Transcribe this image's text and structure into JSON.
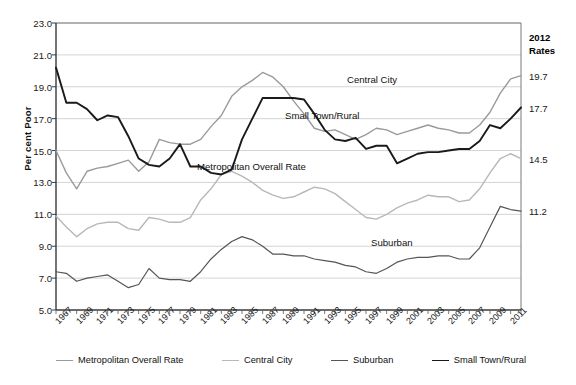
{
  "chart_data": {
    "type": "line",
    "title": "",
    "xlabel": "",
    "ylabel": "Per cent Poor",
    "ylim": [
      5.0,
      23.0
    ],
    "ytick_labels": [
      "23.0",
      "21.0",
      "19.0",
      "17.0",
      "15.0",
      "13.0",
      "11.0",
      "9.0",
      "7.0",
      "5.0"
    ],
    "ytick_values": [
      23.0,
      21.0,
      19.0,
      17.0,
      15.0,
      13.0,
      11.0,
      9.0,
      7.0,
      5.0
    ],
    "grid": true,
    "grid_axis": "y",
    "legend_position": "bottom",
    "x": [
      1967,
      1968,
      1969,
      1970,
      1971,
      1972,
      1973,
      1974,
      1975,
      1976,
      1977,
      1978,
      1979,
      1980,
      1981,
      1982,
      1983,
      1984,
      1985,
      1986,
      1987,
      1988,
      1989,
      1990,
      1991,
      1992,
      1993,
      1994,
      1995,
      1996,
      1997,
      1998,
      1999,
      2000,
      2001,
      2002,
      2003,
      2004,
      2005,
      2006,
      2007,
      2008,
      2009,
      2010,
      2011,
      2012
    ],
    "xtick_labels": [
      "1967",
      "1969",
      "1971",
      "1973",
      "1975",
      "1977",
      "1979",
      "1981",
      "1983",
      "1985",
      "1987",
      "1989",
      "1991",
      "1993",
      "1995",
      "1997",
      "1999",
      "2001",
      "2003",
      "2005",
      "2007",
      "2009",
      "2011"
    ],
    "series": [
      {
        "name": "Metropolitan Overall Rate",
        "color": "#9a9a9a",
        "width": 1.4,
        "end_rate": "14.5",
        "values": [
          15.0,
          13.6,
          12.6,
          13.7,
          13.9,
          14.0,
          14.2,
          14.4,
          13.7,
          14.3,
          15.7,
          15.5,
          15.4,
          15.4,
          15.7,
          16.5,
          17.2,
          18.4,
          19.0,
          19.4,
          19.9,
          19.6,
          19.0,
          18.1,
          17.3,
          16.4,
          16.2,
          16.3,
          16.0,
          15.7,
          16.0,
          16.4,
          16.3,
          16.0,
          16.2,
          16.4,
          16.6,
          16.4,
          16.3,
          16.1,
          16.1,
          16.6,
          17.4,
          18.6,
          19.5,
          19.7
        ]
      },
      {
        "name": "Central City",
        "color": "#b8b8b8",
        "width": 1.4,
        "end_rate": "19.7",
        "values": [
          10.9,
          10.2,
          9.6,
          10.1,
          10.4,
          10.5,
          10.5,
          10.1,
          10.0,
          10.8,
          10.7,
          10.5,
          10.5,
          10.8,
          11.9,
          12.6,
          13.5,
          13.7,
          13.4,
          13.0,
          12.5,
          12.2,
          12.0,
          12.1,
          12.4,
          12.7,
          12.6,
          12.3,
          11.8,
          11.3,
          10.8,
          10.7,
          11.0,
          11.4,
          11.7,
          11.9,
          12.2,
          12.1,
          12.1,
          11.8,
          11.9,
          12.6,
          13.6,
          14.5,
          14.8,
          14.5
        ]
      },
      {
        "name": "Suburban",
        "color": "#555555",
        "width": 1.2,
        "end_rate": "11.2",
        "values": [
          7.4,
          7.3,
          6.8,
          7.0,
          7.1,
          7.2,
          6.8,
          6.4,
          6.6,
          7.6,
          7.0,
          6.9,
          6.9,
          6.8,
          7.4,
          8.2,
          8.8,
          9.3,
          9.6,
          9.4,
          9.0,
          8.5,
          8.5,
          8.4,
          8.4,
          8.2,
          8.1,
          8.0,
          7.8,
          7.7,
          7.4,
          7.3,
          7.6,
          8.0,
          8.2,
          8.3,
          8.3,
          8.4,
          8.4,
          8.2,
          8.2,
          8.9,
          10.2,
          11.5,
          11.3,
          11.2
        ]
      },
      {
        "name": "Small Town/Rural",
        "color": "#1a1a1a",
        "width": 1.9,
        "end_rate": "17.7",
        "values": [
          20.2,
          18.0,
          18.0,
          17.6,
          16.9,
          17.2,
          17.1,
          15.9,
          14.5,
          14.1,
          14.0,
          14.5,
          15.4,
          14.0,
          14.0,
          13.6,
          13.5,
          13.8,
          15.7,
          17.0,
          18.3,
          18.3,
          18.3,
          18.3,
          18.2,
          17.3,
          16.3,
          15.7,
          15.6,
          15.8,
          15.1,
          15.3,
          15.3,
          14.2,
          14.5,
          14.8,
          14.9,
          14.9,
          15.0,
          15.1,
          15.1,
          15.6,
          16.6,
          16.4,
          17.0,
          17.7
        ]
      }
    ],
    "annotations": [
      {
        "text": "Central City",
        "x_px": 347,
        "y_px": 74
      },
      {
        "text": "Small Town/Rural",
        "x_px": 285,
        "y_px": 110
      },
      {
        "text": "Metropolitan Overall Rate",
        "x_px": 197,
        "y_px": 161
      },
      {
        "text": "Suburban",
        "x_px": 371,
        "y_px": 237
      }
    ],
    "right_axis": {
      "header_line1": "2012",
      "header_line2": "Rates",
      "ticks": [
        {
          "label": "19.7",
          "value": 19.7
        },
        {
          "label": "17.7",
          "value": 17.7
        },
        {
          "label": "14.5",
          "value": 14.5
        },
        {
          "label": "11.2",
          "value": 11.2
        }
      ]
    }
  },
  "legend": {
    "items": [
      {
        "label": "Metropolitan Overall Rate",
        "color": "#9a9a9a",
        "width": 1.4
      },
      {
        "label": "Central City",
        "color": "#b8b8b8",
        "width": 1.4
      },
      {
        "label": "Suburban",
        "color": "#555555",
        "width": 1.2
      },
      {
        "label": "Small Town/Rural",
        "color": "#1a1a1a",
        "width": 1.9
      }
    ]
  },
  "caption": ""
}
